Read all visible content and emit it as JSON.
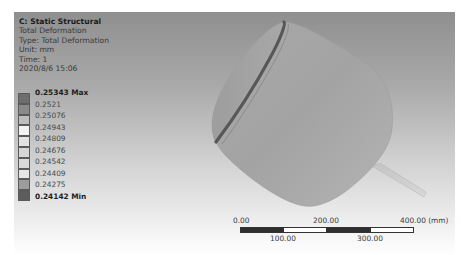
{
  "info": {
    "title": "C: Static Structural",
    "result_name": "Total Deformation",
    "type": "Type: Total Deformation",
    "unit": "Unit: mm",
    "time": "Time: 1",
    "date": "2020/8/6 15:06"
  },
  "legend": {
    "entries": [
      {
        "label": "0.25343 Max",
        "color": "#6e6e6e",
        "bold": true
      },
      {
        "label": "0.2521",
        "color": "#8a8a8a",
        "bold": false
      },
      {
        "label": "0.25076",
        "color": "#bdbdbd",
        "bold": false
      },
      {
        "label": "0.24943",
        "color": "#f2f2f2",
        "bold": false
      },
      {
        "label": "0.24809",
        "color": "#e2e2e2",
        "bold": false
      },
      {
        "label": "0.24676",
        "color": "#d6d6d6",
        "bold": false
      },
      {
        "label": "0.24542",
        "color": "#dadada",
        "bold": false
      },
      {
        "label": "0.24409",
        "color": "#e6e6e6",
        "bold": false
      },
      {
        "label": "0.24275",
        "color": "#9c9c9c",
        "bold": false
      },
      {
        "label": "0.24142 Min",
        "color": "#5c5c5c",
        "bold": true
      }
    ]
  },
  "scale_bar": {
    "ticks_top": [
      "0.00",
      "200.00",
      "400.00 (mm)"
    ],
    "ticks_bottom": [
      "100.00",
      "300.00"
    ]
  },
  "model": {
    "name": "pressure-vessel-with-nozzle",
    "body_color": "#a6a6a6",
    "rim_color": "#555555"
  }
}
